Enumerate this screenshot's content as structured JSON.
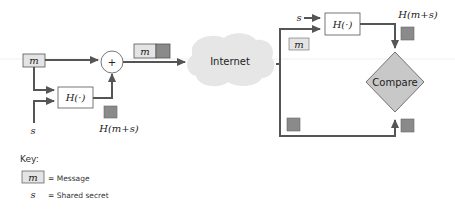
{
  "sender": {
    "message_label": "m",
    "plus_label": "+",
    "hash_label": "H(·)",
    "secret_label": "s",
    "hash_output_label": "H(m+s)",
    "packet_message_label": "m"
  },
  "network": {
    "label": "Internet"
  },
  "receiver": {
    "secret_label": "s",
    "hash_label": "H(·)",
    "hash_output_label": "H(m+s)",
    "message_label": "m",
    "compare_label": "Compare"
  },
  "key": {
    "title": "Key:",
    "items": [
      {
        "symbol": "m",
        "description": "= Message"
      },
      {
        "symbol": "s",
        "description": "= Shared secret"
      }
    ]
  },
  "colors": {
    "arrow": "#555555",
    "message_box": "#e4e4e4",
    "hash_square": "#8a8a8a",
    "cloud": "#e6e6e6",
    "compare": "#c8c8c8"
  }
}
